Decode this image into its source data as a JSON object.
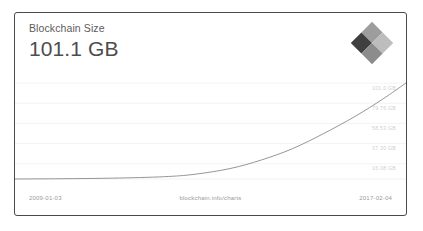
{
  "card": {
    "border_color": "#4a4a4a",
    "background": "#ffffff"
  },
  "header": {
    "title": "Blockchain Size",
    "value": "101.1 GB"
  },
  "logo": {
    "name": "blockchain-diamond-logo",
    "colors": {
      "top_left": "#9d9d9d",
      "top_right": "#bdbdbd",
      "bottom_left": "#3f3f3f",
      "bottom_right": "#8c8c8c"
    }
  },
  "footer": {
    "start_date": "2009-01-03",
    "source": "blockchain.info/charts",
    "end_date": "2017-02-04"
  },
  "chart_data": {
    "type": "line",
    "title": "Blockchain Size",
    "xlabel": "",
    "ylabel": "",
    "grid": true,
    "legend": null,
    "line_color": "#8a8a8a",
    "gridline_color": "#f0f0f0",
    "ytick_color": "#cfcfcf",
    "ytick_labels": [
      "101.0 GB",
      "79.76 GB",
      "58.53 GB",
      "37.30 GB",
      "16.08 GB"
    ],
    "ytick_values": [
      101.0,
      79.76,
      58.53,
      37.3,
      16.08
    ],
    "ylim": [
      0,
      101.1
    ],
    "xlim": [
      "2009-01-03",
      "2017-02-04"
    ],
    "x": [
      "2009-01-03",
      "2010-01-03",
      "2011-01-03",
      "2012-01-03",
      "2013-01-03",
      "2014-01-03",
      "2015-01-03",
      "2016-01-03",
      "2016-07-03",
      "2017-02-04"
    ],
    "values": [
      0.0,
      0.05,
      0.3,
      1.2,
      4.5,
      14.0,
      30.0,
      60.0,
      78.0,
      101.1
    ],
    "ylabel_unit": "GB",
    "points": [
      {
        "x": 0.0,
        "y": 0.0
      },
      {
        "x": 0.12,
        "y": 0.3
      },
      {
        "x": 0.25,
        "y": 0.9
      },
      {
        "x": 0.38,
        "y": 2.4
      },
      {
        "x": 0.46,
        "y": 5.0
      },
      {
        "x": 0.55,
        "y": 11.0
      },
      {
        "x": 0.63,
        "y": 20.0
      },
      {
        "x": 0.71,
        "y": 32.0
      },
      {
        "x": 0.79,
        "y": 48.0
      },
      {
        "x": 0.87,
        "y": 66.0
      },
      {
        "x": 0.94,
        "y": 84.0
      },
      {
        "x": 1.0,
        "y": 101.1
      }
    ]
  }
}
